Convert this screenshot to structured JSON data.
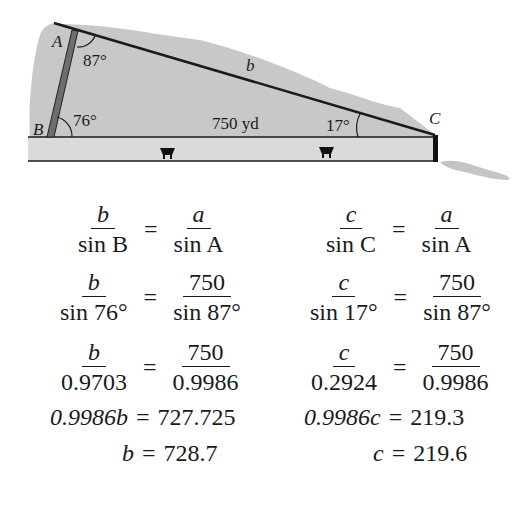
{
  "diagram": {
    "vertices": {
      "A": "A",
      "B": "B",
      "C": "C"
    },
    "angles": {
      "A": "87°",
      "B": "76°",
      "C": "17°"
    },
    "side_b_label": "b",
    "distance_label": "750 yd",
    "colors": {
      "terrain": "#c8c8c8",
      "pole": "#6e6e6e",
      "line": "#1a1a1a",
      "road": "#dcdcdc"
    }
  },
  "equations": {
    "left": {
      "r1": {
        "num1": "b",
        "den1": "sin B",
        "num2": "a",
        "den2": "sin A"
      },
      "r2": {
        "num1": "b",
        "den1": "sin 76°",
        "num2": "750",
        "den2": "sin 87°"
      },
      "r3": {
        "num1": "b",
        "den1": "0.9703",
        "num2": "750",
        "den2": "0.9986"
      },
      "r4": {
        "lhs": "0.9986b",
        "rhs": "727.725"
      },
      "r5": {
        "lhs": "b",
        "rhs": "728.7"
      }
    },
    "right": {
      "r1": {
        "num1": "c",
        "den1": "sin C",
        "num2": "a",
        "den2": "sin A"
      },
      "r2": {
        "num1": "c",
        "den1": "sin 17°",
        "num2": "750",
        "den2": "sin 87°"
      },
      "r3": {
        "num1": "c",
        "den1": "0.2924",
        "num2": "750",
        "den2": "0.9986"
      },
      "r4": {
        "lhs": "0.9986c",
        "rhs": "219.3"
      },
      "r5": {
        "lhs": "c",
        "rhs": "219.6"
      }
    },
    "equals": "="
  }
}
